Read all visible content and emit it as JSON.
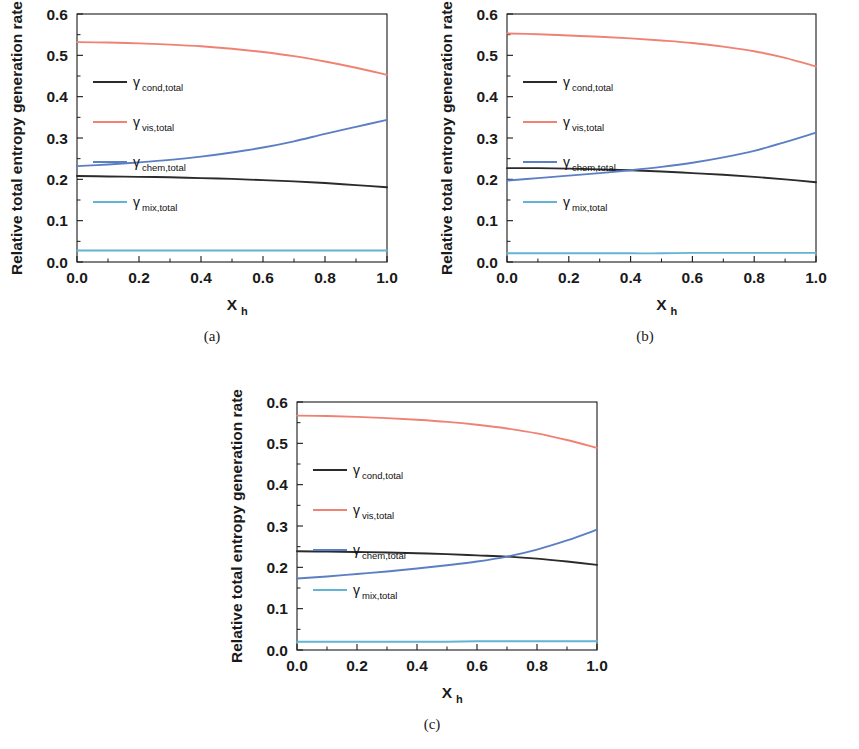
{
  "figure": {
    "panels": [
      {
        "id": "a",
        "caption": "(a)"
      },
      {
        "id": "b",
        "caption": "(b)"
      },
      {
        "id": "c",
        "caption": "(c)"
      }
    ]
  },
  "axis": {
    "ylabel": "Relative total entropy generation rate",
    "xlabel_base": "X",
    "xlabel_sub": "h",
    "xticks": [
      "0.0",
      "0.2",
      "0.4",
      "0.6",
      "0.8",
      "1.0"
    ],
    "yticks": [
      "0.0",
      "0.1",
      "0.2",
      "0.3",
      "0.4",
      "0.5",
      "0.6"
    ]
  },
  "legend": {
    "entries": [
      {
        "symbol": "γ",
        "sub": "cond,total",
        "color": "#2b2b2b"
      },
      {
        "symbol": "γ",
        "sub": "vis,total",
        "color": "#f08273"
      },
      {
        "symbol": "γ",
        "sub": "chem,total",
        "color": "#5c7fc4"
      },
      {
        "symbol": "γ",
        "sub": "mix,total",
        "color": "#62b4d2"
      }
    ]
  },
  "colors": {
    "cond": "#2b2b2b",
    "vis": "#f08273",
    "chem": "#5c7fc4",
    "mix": "#62b4d2",
    "axis": "#1a1a1a",
    "background": "#ffffff"
  },
  "chart_data": [
    {
      "type": "line",
      "panel": "(a)",
      "title": "",
      "xlabel": "X_h",
      "ylabel": "Relative total entropy generation rate",
      "xlim": [
        0.0,
        1.0
      ],
      "ylim": [
        0.0,
        0.6
      ],
      "grid": false,
      "legend_position": "upper-left-inside",
      "x": [
        0.0,
        0.1,
        0.2,
        0.3,
        0.4,
        0.5,
        0.6,
        0.7,
        0.8,
        0.9,
        1.0
      ],
      "series": [
        {
          "name": "γ cond,total",
          "color": "#2b2b2b",
          "values": [
            0.208,
            0.207,
            0.206,
            0.205,
            0.203,
            0.201,
            0.198,
            0.195,
            0.191,
            0.186,
            0.181
          ]
        },
        {
          "name": "γ vis,total",
          "color": "#f08273",
          "values": [
            0.532,
            0.531,
            0.529,
            0.526,
            0.522,
            0.516,
            0.508,
            0.498,
            0.485,
            0.47,
            0.453
          ]
        },
        {
          "name": "γ chem,total",
          "color": "#5c7fc4",
          "values": [
            0.232,
            0.236,
            0.241,
            0.247,
            0.255,
            0.265,
            0.277,
            0.292,
            0.31,
            0.327,
            0.344
          ]
        },
        {
          "name": "γ mix,total",
          "color": "#62b4d2",
          "values": [
            0.028,
            0.028,
            0.028,
            0.028,
            0.028,
            0.028,
            0.028,
            0.028,
            0.028,
            0.028,
            0.028
          ]
        }
      ]
    },
    {
      "type": "line",
      "panel": "(b)",
      "title": "",
      "xlabel": "X_h",
      "ylabel": "Relative total entropy generation rate",
      "xlim": [
        0.0,
        1.0
      ],
      "ylim": [
        0.0,
        0.6
      ],
      "grid": false,
      "legend_position": "upper-left-inside",
      "x": [
        0.0,
        0.1,
        0.2,
        0.3,
        0.4,
        0.5,
        0.6,
        0.7,
        0.8,
        0.9,
        1.0
      ],
      "series": [
        {
          "name": "γ cond,total",
          "color": "#2b2b2b",
          "values": [
            0.227,
            0.227,
            0.226,
            0.224,
            0.222,
            0.219,
            0.215,
            0.211,
            0.206,
            0.2,
            0.193
          ]
        },
        {
          "name": "γ vis,total",
          "color": "#f08273",
          "values": [
            0.553,
            0.551,
            0.548,
            0.545,
            0.541,
            0.536,
            0.53,
            0.521,
            0.51,
            0.494,
            0.473
          ]
        },
        {
          "name": "γ chem,total",
          "color": "#5c7fc4",
          "values": [
            0.197,
            0.203,
            0.209,
            0.215,
            0.222,
            0.23,
            0.24,
            0.253,
            0.269,
            0.29,
            0.313
          ]
        },
        {
          "name": "γ mix,total",
          "color": "#62b4d2",
          "values": [
            0.021,
            0.021,
            0.021,
            0.021,
            0.021,
            0.021,
            0.022,
            0.022,
            0.022,
            0.022,
            0.022
          ]
        }
      ]
    },
    {
      "type": "line",
      "panel": "(c)",
      "title": "",
      "xlabel": "X_h",
      "ylabel": "Relative total entropy generation rate",
      "xlim": [
        0.0,
        1.0
      ],
      "ylim": [
        0.0,
        0.6
      ],
      "grid": false,
      "legend_position": "upper-left-inside",
      "x": [
        0.0,
        0.1,
        0.2,
        0.3,
        0.4,
        0.5,
        0.6,
        0.7,
        0.8,
        0.9,
        1.0
      ],
      "series": [
        {
          "name": "γ cond,total",
          "color": "#2b2b2b",
          "values": [
            0.239,
            0.238,
            0.237,
            0.236,
            0.234,
            0.232,
            0.229,
            0.226,
            0.221,
            0.214,
            0.206
          ]
        },
        {
          "name": "γ vis,total",
          "color": "#f08273",
          "values": [
            0.567,
            0.566,
            0.564,
            0.561,
            0.557,
            0.552,
            0.545,
            0.536,
            0.524,
            0.508,
            0.489
          ]
        },
        {
          "name": "γ chem,total",
          "color": "#5c7fc4",
          "values": [
            0.173,
            0.178,
            0.184,
            0.19,
            0.197,
            0.205,
            0.214,
            0.226,
            0.243,
            0.265,
            0.291
          ]
        },
        {
          "name": "γ mix,total",
          "color": "#62b4d2",
          "values": [
            0.02,
            0.02,
            0.02,
            0.02,
            0.02,
            0.02,
            0.021,
            0.021,
            0.021,
            0.021,
            0.021
          ]
        }
      ]
    }
  ]
}
